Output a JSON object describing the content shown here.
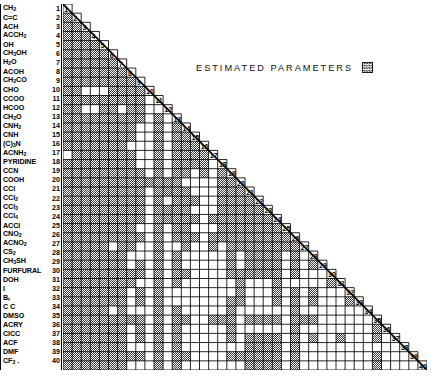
{
  "legend": {
    "text": "ESTIMATED PARAMETERS",
    "swatch_name": "hatched-square",
    "swatch_color": "#6b6b6b"
  },
  "matrix": {
    "rows": 40,
    "columns": 40,
    "shape": "lower-triangular",
    "diagonal_shows_index": true,
    "fill_color": "#7a7a7a",
    "empty_color": "#ffffff",
    "grid_line_color": "#000000"
  },
  "groups": [
    {
      "index": 1,
      "name": "CH2",
      "html": "CH<sub>2</sub>"
    },
    {
      "index": 2,
      "name": "C=C",
      "html": "C=C"
    },
    {
      "index": 3,
      "name": "ACH",
      "html": "ACH"
    },
    {
      "index": 4,
      "name": "ACCH2",
      "html": "ACCH<sub>2</sub>"
    },
    {
      "index": 5,
      "name": "OH",
      "html": "OH"
    },
    {
      "index": 6,
      "name": "CH3OH",
      "html": "CH<sub>3</sub>OH"
    },
    {
      "index": 7,
      "name": "H2O",
      "html": "H<sub>2</sub>O"
    },
    {
      "index": 8,
      "name": "ACOH",
      "html": "ACOH"
    },
    {
      "index": 9,
      "name": "CH2CO",
      "html": "CH<sub>2</sub>CO"
    },
    {
      "index": 10,
      "name": "CHO",
      "html": "CHO"
    },
    {
      "index": 11,
      "name": "CCOO",
      "html": "CCOO"
    },
    {
      "index": 12,
      "name": "HCOO",
      "html": "HCOO"
    },
    {
      "index": 13,
      "name": "CH2O",
      "html": "CH<sub>2</sub>O"
    },
    {
      "index": 14,
      "name": "CNH2",
      "html": "CNH<sub>2</sub>"
    },
    {
      "index": 15,
      "name": "CNH",
      "html": "CNH"
    },
    {
      "index": 16,
      "name": "(C)3N",
      "html": "(C)<sub>3</sub>N"
    },
    {
      "index": 17,
      "name": "ACNH2",
      "html": "ACNH<sub>2</sub>"
    },
    {
      "index": 18,
      "name": "PYRIDINE",
      "html": "PYRIDINE"
    },
    {
      "index": 19,
      "name": "CCN",
      "html": "CCN"
    },
    {
      "index": 20,
      "name": "COOH",
      "html": "COOH"
    },
    {
      "index": 21,
      "name": "CCl",
      "html": "CCl"
    },
    {
      "index": 22,
      "name": "CCl2",
      "html": "CCl<sub>2</sub>"
    },
    {
      "index": 23,
      "name": "CCl3",
      "html": "CCl<sub>3</sub>"
    },
    {
      "index": 24,
      "name": "CCl4",
      "html": "CCl<sub>4</sub>"
    },
    {
      "index": 25,
      "name": "ACCl",
      "html": "ACCl"
    },
    {
      "index": 26,
      "name": "CNO2",
      "html": "CNO<sub>2</sub>"
    },
    {
      "index": 27,
      "name": "ACNO2",
      "html": "ACNO<sub>2</sub>"
    },
    {
      "index": 28,
      "name": "CS2",
      "html": "CS<sub>2</sub>"
    },
    {
      "index": 29,
      "name": "CH3SH",
      "html": "CH<sub>3</sub>SH"
    },
    {
      "index": 30,
      "name": "FURFURAL",
      "html": "FURFURAL"
    },
    {
      "index": 31,
      "name": "DOH",
      "html": "DOH"
    },
    {
      "index": 32,
      "name": "I",
      "html": "I"
    },
    {
      "index": 33,
      "name": "Br",
      "html": "B<sub>r</sub>"
    },
    {
      "index": 34,
      "name": "C C",
      "html": "C C"
    },
    {
      "index": 35,
      "name": "DMSO",
      "html": "DMSO"
    },
    {
      "index": 36,
      "name": "ACRY",
      "html": "ACRY"
    },
    {
      "index": 37,
      "name": "ClCC",
      "html": "ClCC"
    },
    {
      "index": 38,
      "name": "ACF",
      "html": "ACF"
    },
    {
      "index": 39,
      "name": "DMF",
      "html": "DMF"
    },
    {
      "index": 40,
      "name": "CF2",
      "html": "CF<sub>2</sub> ."
    }
  ],
  "chart_data": {
    "type": "heatmap",
    "title": "",
    "xlabel": "",
    "ylabel": "",
    "legend": [
      "ESTIMATED PARAMETERS"
    ],
    "grid": true,
    "note": "Lower-triangular 40x40 binary matrix. Value 1 = estimated parameter (hatched grey cell); 0 = empty (white cell). Row r lists entries for columns 1..r-1; the cell at column r on the diagonal carries the row index number.",
    "xlim": [
      1,
      40
    ],
    "ylim": [
      1,
      40
    ],
    "categories": [
      "CH2",
      "C=C",
      "ACH",
      "ACCH2",
      "OH",
      "CH3OH",
      "H2O",
      "ACOH",
      "CH2CO",
      "CHO",
      "CCOO",
      "HCOO",
      "CH2O",
      "CNH2",
      "CNH",
      "(C)3N",
      "ACNH2",
      "PYRIDINE",
      "CCN",
      "COOH",
      "CCl",
      "CCl2",
      "CCl3",
      "CCl4",
      "ACCl",
      "CNO2",
      "ACNO2",
      "CS2",
      "CH3SH",
      "FURFURAL",
      "DOH",
      "I",
      "Br",
      "C C",
      "DMSO",
      "ACRY",
      "ClCC",
      "ACF",
      "DMF",
      "CF2"
    ],
    "values": [
      [],
      [
        1
      ],
      [
        1,
        1
      ],
      [
        1,
        1,
        1
      ],
      [
        1,
        1,
        1,
        1
      ],
      [
        1,
        1,
        1,
        1,
        1
      ],
      [
        1,
        1,
        1,
        1,
        1,
        1
      ],
      [
        1,
        1,
        1,
        1,
        1,
        1,
        1
      ],
      [
        1,
        1,
        1,
        1,
        1,
        1,
        1,
        1
      ],
      [
        1,
        1,
        0,
        0,
        0,
        1,
        1,
        1,
        1
      ],
      [
        1,
        1,
        1,
        1,
        1,
        1,
        1,
        1,
        1,
        0
      ],
      [
        1,
        1,
        0,
        0,
        1,
        1,
        0,
        1,
        1,
        0,
        0
      ],
      [
        1,
        1,
        1,
        1,
        1,
        1,
        1,
        1,
        1,
        0,
        1,
        0
      ],
      [
        1,
        1,
        1,
        1,
        1,
        1,
        1,
        1,
        0,
        0,
        1,
        0,
        1
      ],
      [
        1,
        1,
        1,
        1,
        1,
        1,
        1,
        1,
        0,
        0,
        1,
        0,
        1,
        1
      ],
      [
        1,
        1,
        1,
        1,
        1,
        1,
        1,
        0,
        0,
        0,
        1,
        0,
        1,
        1,
        1
      ],
      [
        0,
        1,
        1,
        1,
        1,
        1,
        1,
        1,
        0,
        0,
        1,
        0,
        1,
        1,
        1,
        1
      ],
      [
        1,
        1,
        1,
        1,
        1,
        1,
        1,
        1,
        0,
        0,
        1,
        0,
        1,
        1,
        1,
        1,
        0
      ],
      [
        1,
        1,
        1,
        1,
        1,
        1,
        1,
        1,
        1,
        0,
        1,
        0,
        1,
        1,
        0,
        1,
        0,
        1
      ],
      [
        1,
        1,
        1,
        1,
        1,
        1,
        1,
        1,
        1,
        1,
        1,
        1,
        1,
        0,
        0,
        0,
        0,
        1,
        1
      ],
      [
        1,
        1,
        1,
        1,
        1,
        1,
        1,
        1,
        1,
        0,
        1,
        1,
        1,
        1,
        0,
        0,
        0,
        1,
        1,
        1
      ],
      [
        1,
        1,
        1,
        1,
        1,
        1,
        1,
        1,
        1,
        0,
        1,
        0,
        1,
        1,
        1,
        0,
        0,
        1,
        1,
        1,
        1
      ],
      [
        1,
        1,
        1,
        1,
        1,
        1,
        1,
        1,
        1,
        0,
        1,
        1,
        1,
        1,
        0,
        0,
        0,
        1,
        1,
        1,
        1,
        1
      ],
      [
        1,
        1,
        1,
        1,
        1,
        1,
        1,
        1,
        1,
        0,
        1,
        1,
        1,
        1,
        1,
        0,
        1,
        1,
        1,
        1,
        1,
        1,
        1
      ],
      [
        1,
        1,
        1,
        1,
        1,
        1,
        1,
        1,
        0,
        0,
        1,
        0,
        1,
        1,
        0,
        0,
        0,
        1,
        1,
        1,
        1,
        1,
        1,
        1
      ],
      [
        1,
        1,
        1,
        1,
        1,
        1,
        1,
        1,
        1,
        0,
        1,
        0,
        1,
        1,
        1,
        0,
        1,
        1,
        1,
        1,
        1,
        1,
        1,
        1,
        1
      ],
      [
        1,
        1,
        1,
        1,
        1,
        0,
        1,
        1,
        0,
        0,
        1,
        0,
        0,
        1,
        0,
        0,
        1,
        0,
        1,
        1,
        1,
        1,
        1,
        1,
        1,
        1
      ],
      [
        1,
        1,
        1,
        1,
        1,
        1,
        1,
        0,
        0,
        0,
        1,
        0,
        1,
        0,
        0,
        0,
        0,
        0,
        1,
        0,
        1,
        1,
        1,
        1,
        0,
        1,
        0
      ],
      [
        1,
        1,
        1,
        1,
        1,
        1,
        1,
        0,
        1,
        0,
        1,
        0,
        1,
        0,
        0,
        0,
        0,
        0,
        1,
        0,
        1,
        1,
        1,
        1,
        0,
        1,
        0,
        1
      ],
      [
        1,
        1,
        1,
        1,
        1,
        1,
        1,
        1,
        1,
        0,
        1,
        0,
        1,
        1,
        0,
        0,
        0,
        0,
        1,
        1,
        1,
        1,
        1,
        1,
        0,
        1,
        0,
        0,
        0
      ],
      [
        1,
        1,
        1,
        1,
        1,
        1,
        1,
        1,
        0,
        0,
        1,
        0,
        1,
        0,
        0,
        0,
        0,
        0,
        0,
        1,
        0,
        0,
        0,
        1,
        0,
        0,
        0,
        0,
        0,
        1
      ],
      [
        1,
        1,
        1,
        1,
        1,
        1,
        1,
        0,
        1,
        0,
        1,
        0,
        0,
        0,
        0,
        0,
        0,
        0,
        0,
        1,
        0,
        0,
        0,
        1,
        0,
        1,
        0,
        1,
        0,
        0,
        0
      ],
      [
        1,
        1,
        1,
        1,
        1,
        1,
        1,
        0,
        1,
        0,
        1,
        0,
        0,
        0,
        0,
        0,
        0,
        0,
        1,
        1,
        0,
        0,
        0,
        1,
        0,
        1,
        0,
        1,
        0,
        0,
        0,
        1
      ],
      [
        1,
        1,
        1,
        1,
        1,
        0,
        1,
        0,
        0,
        0,
        1,
        0,
        1,
        0,
        0,
        0,
        0,
        0,
        1,
        0,
        0,
        0,
        0,
        0,
        0,
        1,
        0,
        0,
        0,
        0,
        0,
        0,
        0
      ],
      [
        1,
        1,
        1,
        1,
        1,
        1,
        1,
        1,
        1,
        0,
        1,
        0,
        1,
        1,
        0,
        0,
        1,
        1,
        1,
        0,
        1,
        1,
        1,
        1,
        0,
        1,
        1,
        1,
        0,
        0,
        0,
        0,
        0,
        0
      ],
      [
        1,
        1,
        1,
        1,
        1,
        1,
        1,
        0,
        1,
        0,
        1,
        0,
        1,
        0,
        0,
        0,
        0,
        0,
        1,
        0,
        0,
        0,
        0,
        0,
        0,
        1,
        0,
        0,
        0,
        0,
        0,
        0,
        0,
        0,
        1
      ],
      [
        1,
        1,
        1,
        1,
        1,
        1,
        1,
        0,
        1,
        0,
        1,
        0,
        1,
        0,
        0,
        0,
        0,
        0,
        1,
        0,
        1,
        1,
        1,
        1,
        0,
        1,
        0,
        1,
        0,
        0,
        1,
        0,
        0,
        0,
        1,
        0
      ],
      [
        1,
        1,
        1,
        1,
        1,
        1,
        1,
        0,
        0,
        0,
        1,
        0,
        1,
        0,
        0,
        0,
        0,
        0,
        0,
        0,
        1,
        1,
        1,
        1,
        0,
        1,
        0,
        0,
        0,
        0,
        0,
        0,
        0,
        0,
        0,
        0,
        0
      ],
      [
        1,
        1,
        1,
        1,
        1,
        1,
        1,
        1,
        1,
        0,
        1,
        0,
        1,
        1,
        0,
        0,
        0,
        0,
        1,
        1,
        1,
        1,
        1,
        1,
        0,
        1,
        0,
        0,
        0,
        0,
        0,
        0,
        0,
        0,
        1,
        0,
        0,
        0
      ],
      [
        1,
        1,
        1,
        1,
        1,
        1,
        1,
        0,
        0,
        0,
        1,
        0,
        1,
        0,
        0,
        0,
        0,
        0,
        0,
        0,
        1,
        1,
        1,
        1,
        0,
        1,
        0,
        0,
        0,
        0,
        0,
        0,
        0,
        0,
        1,
        0,
        0,
        0,
        0
      ]
    ]
  }
}
